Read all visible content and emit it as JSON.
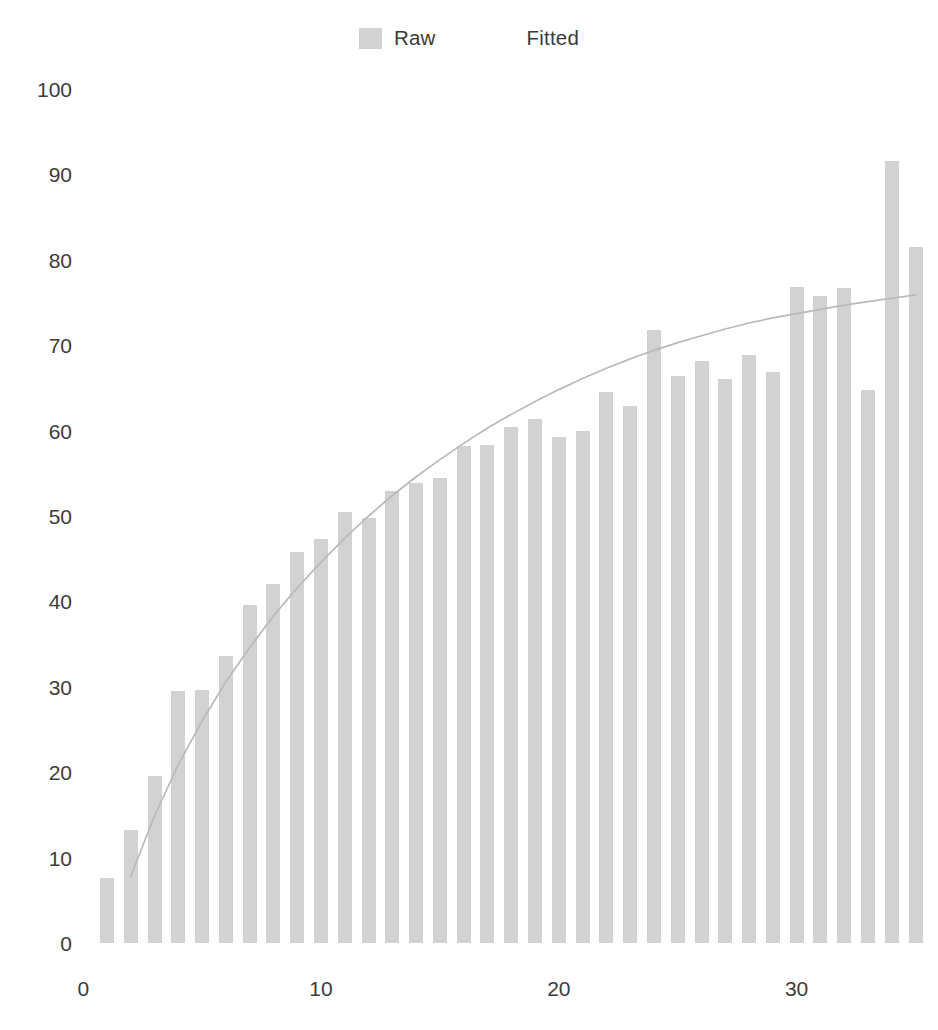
{
  "legend": {
    "position": "top-center",
    "entries": [
      {
        "label": "Raw",
        "marker": "filled-square-swatch",
        "color": "#d2d2d2"
      },
      {
        "label": "Fitted",
        "marker": "line-swatch",
        "color": "#fdfdfd"
      }
    ]
  },
  "colors": {
    "bar": "#d2d2d2",
    "curve": "#b9b9b9",
    "text": "#3c3c3c",
    "background": "#ffffff"
  },
  "chart_data": {
    "type": "bar",
    "title": "",
    "subtitle": "",
    "xlabel": "",
    "ylabel": "",
    "grid": false,
    "legend_position": "top-center",
    "xlim": [
      0,
      36
    ],
    "ylim": [
      0,
      105
    ],
    "xticks": [
      "0",
      "10",
      "20",
      "30"
    ],
    "xtick_values": [
      0,
      10,
      20,
      30
    ],
    "yticks": [
      "0",
      "10",
      "20",
      "30",
      "40",
      "50",
      "60",
      "70",
      "80",
      "90",
      "100"
    ],
    "ytick_values": [
      0,
      10,
      20,
      30,
      40,
      50,
      60,
      70,
      80,
      90,
      100
    ],
    "categories": [
      1,
      2,
      3,
      4,
      5,
      6,
      7,
      8,
      9,
      10,
      11,
      12,
      13,
      14,
      15,
      16,
      17,
      18,
      19,
      20,
      21,
      22,
      23,
      24,
      25,
      26,
      27,
      28,
      29,
      30,
      31,
      32,
      33,
      34,
      35
    ],
    "series": [
      {
        "name": "Raw",
        "type": "bar",
        "color": "#d2d2d2",
        "values": [
          7.6,
          13.2,
          19.6,
          29.5,
          29.6,
          33.6,
          39.6,
          42.0,
          45.8,
          47.3,
          50.5,
          49.8,
          52.9,
          53.9,
          54.5,
          58.2,
          58.3,
          60.4,
          61.3,
          59.3,
          60.0,
          64.5,
          62.9,
          71.8,
          66.4,
          68.1,
          66.0,
          68.8,
          66.9,
          76.8,
          75.8,
          76.7,
          64.8,
          91.6,
          81.5
        ]
      },
      {
        "name": "Fitted",
        "type": "line",
        "color": "#b9b9b9",
        "x": [
          2,
          3,
          4,
          5,
          6,
          7,
          8,
          9,
          10,
          11,
          12,
          13,
          14,
          15,
          16,
          17,
          18,
          19,
          20,
          21,
          22,
          23,
          24,
          25,
          26,
          27,
          28,
          29,
          30,
          31,
          32,
          33,
          34,
          35
        ],
        "values": [
          7.8,
          14.9,
          20.9,
          26.0,
          30.6,
          34.6,
          38.3,
          41.6,
          44.6,
          47.4,
          50.0,
          52.4,
          54.6,
          56.6,
          58.5,
          60.3,
          61.9,
          63.4,
          64.8,
          66.1,
          67.3,
          68.4,
          69.4,
          70.3,
          71.1,
          71.9,
          72.6,
          73.2,
          73.7,
          74.2,
          74.7,
          75.1,
          75.5,
          75.9
        ]
      }
    ]
  }
}
